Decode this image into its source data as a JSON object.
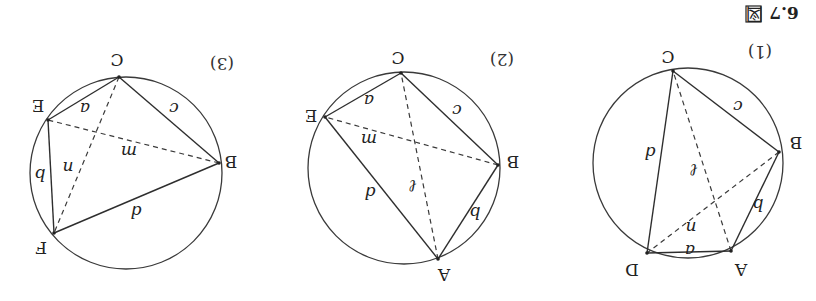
{
  "caption": {
    "prefix": "図",
    "number": "6.7",
    "orientation": "rotated 180°"
  },
  "panels": [
    {
      "id": "1",
      "label": "(1)",
      "vertices": [
        {
          "name": "A",
          "label": "A"
        },
        {
          "name": "B",
          "label": "B"
        },
        {
          "name": "C",
          "label": "C"
        },
        {
          "name": "D",
          "label": "D"
        }
      ],
      "sides": [
        {
          "from": "A",
          "to": "D",
          "label": "a"
        },
        {
          "from": "A",
          "to": "B",
          "label": "b"
        },
        {
          "from": "B",
          "to": "C",
          "label": "c"
        },
        {
          "from": "C",
          "to": "D",
          "label": "d"
        }
      ],
      "diagonals": [
        {
          "from": "A",
          "to": "C",
          "label": "ℓ"
        },
        {
          "from": "B",
          "to": "D",
          "label": "n"
        }
      ]
    },
    {
      "id": "2",
      "label": "(2)",
      "vertices": [
        {
          "name": "A",
          "label": "A"
        },
        {
          "name": "B",
          "label": "B"
        },
        {
          "name": "C",
          "label": "C"
        },
        {
          "name": "E",
          "label": "E"
        }
      ],
      "sides": [
        {
          "from": "C",
          "to": "E",
          "label": "a"
        },
        {
          "from": "A",
          "to": "B",
          "label": "b"
        },
        {
          "from": "B",
          "to": "C",
          "label": "c"
        },
        {
          "from": "A",
          "to": "E",
          "label": "d"
        }
      ],
      "diagonals": [
        {
          "from": "A",
          "to": "C",
          "label": "ℓ"
        },
        {
          "from": "B",
          "to": "E",
          "label": "m"
        }
      ]
    },
    {
      "id": "3",
      "label": "(3)",
      "vertices": [
        {
          "name": "B",
          "label": "B"
        },
        {
          "name": "C",
          "label": "C"
        },
        {
          "name": "E",
          "label": "E"
        },
        {
          "name": "F",
          "label": "F"
        }
      ],
      "sides": [
        {
          "from": "C",
          "to": "E",
          "label": "a"
        },
        {
          "from": "E",
          "to": "F",
          "label": "b"
        },
        {
          "from": "B",
          "to": "C",
          "label": "c"
        },
        {
          "from": "B",
          "to": "F",
          "label": "d"
        }
      ],
      "diagonals": [
        {
          "from": "B",
          "to": "E",
          "label": "m"
        },
        {
          "from": "C",
          "to": "F",
          "label": "n"
        }
      ]
    }
  ]
}
